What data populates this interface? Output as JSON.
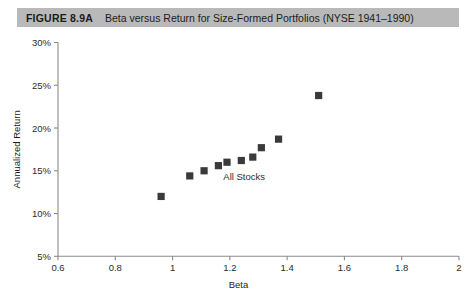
{
  "caption": {
    "figure_number": "FIGURE 8.9A",
    "title": "Beta versus Return for Size-Formed Portfolios (NYSE 1941–1990)",
    "bar_color": "#b9b9b9"
  },
  "chart_data": {
    "type": "scatter",
    "title": "Beta versus Return for Size-Formed Portfolios (NYSE 1941–1990)",
    "xlabel": "Beta",
    "ylabel": "Annualized Return",
    "xlim": [
      0.6,
      2.0
    ],
    "ylim": [
      5,
      30
    ],
    "grid": false,
    "legend": "none",
    "marker": "square",
    "marker_color": "#3a3a3a",
    "xticks": [
      0.6,
      0.8,
      1.0,
      1.2,
      1.4,
      1.6,
      1.8,
      2.0
    ],
    "xtick_labels": [
      "0.6",
      "0.8",
      "1",
      "1.2",
      "1.4",
      "1.6",
      "1.8",
      "2"
    ],
    "yticks": [
      5,
      10,
      15,
      20,
      25,
      30
    ],
    "ytick_labels": [
      "5%",
      "10%",
      "15%",
      "20%",
      "25%",
      "30%"
    ],
    "annotations": [
      {
        "text": "All Stocks",
        "x": 1.25,
        "y": 13.9
      }
    ],
    "series": [
      {
        "name": "Size-Formed Portfolios",
        "x": [
          0.96,
          1.06,
          1.11,
          1.16,
          1.19,
          1.24,
          1.28,
          1.31,
          1.37,
          1.51
        ],
        "y": [
          12.0,
          14.4,
          15.0,
          15.6,
          16.0,
          16.2,
          16.6,
          17.7,
          18.7,
          23.8
        ]
      }
    ]
  }
}
